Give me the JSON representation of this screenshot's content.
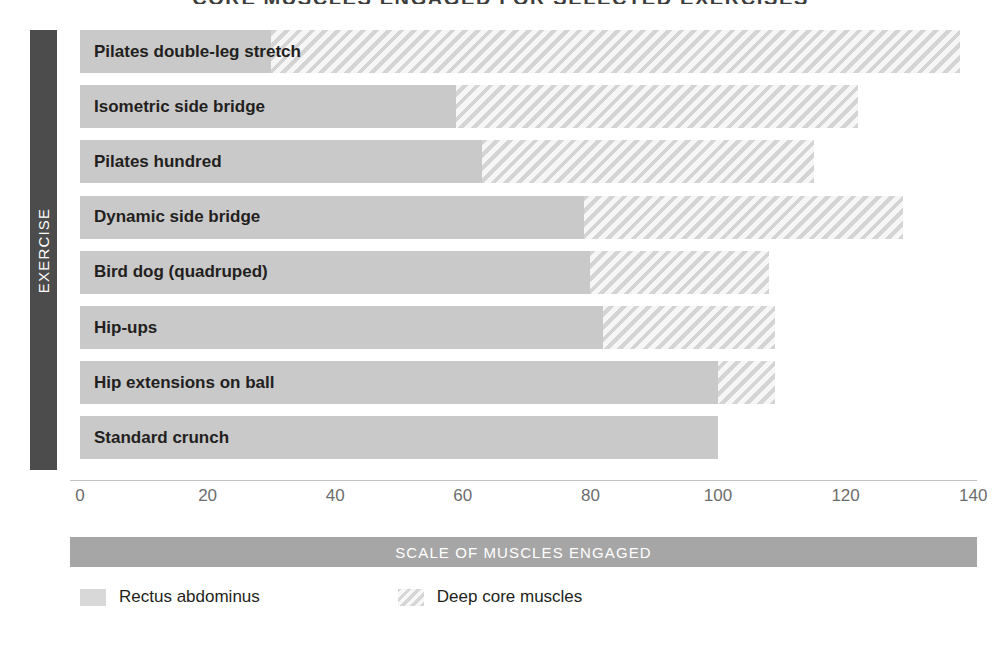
{
  "chart_data": {
    "type": "bar",
    "orientation": "horizontal",
    "stacked": true,
    "title": "CORE MUSCLES ENGAGED FOR SELECTED EXERCISES",
    "xlabel": "SCALE OF MUSCLES ENGAGED",
    "ylabel": "EXERCISE",
    "xlim": [
      0,
      140
    ],
    "xticks": [
      0,
      20,
      40,
      60,
      80,
      100,
      120,
      140
    ],
    "xtick_labels": [
      "0",
      "20",
      "40",
      "60",
      "80",
      "100",
      "120",
      "140"
    ],
    "grid": false,
    "legend_position": "bottom-left",
    "categories": [
      "Pilates double-leg stretch",
      "Isometric side bridge",
      "Pilates hundred",
      "Dynamic side bridge",
      "Bird dog (quadruped)",
      "Hip-ups",
      "Hip extensions on ball",
      "Standard crunch"
    ],
    "series": [
      {
        "name": "Rectus abdominus",
        "pattern": "solid",
        "color": "#c9c9c9",
        "values": [
          30,
          59,
          63,
          79,
          80,
          82,
          100,
          100
        ]
      },
      {
        "name": "Deep core muscles",
        "pattern": "diagonal-hatch",
        "color": "#eeeeee",
        "values": [
          108,
          63,
          52,
          50,
          28,
          27,
          9,
          0
        ]
      }
    ],
    "totals": [
      138,
      122,
      115,
      129,
      108,
      109,
      109,
      100
    ]
  },
  "legend": {
    "items": [
      {
        "label": "Rectus abdominus",
        "swatch": "solid"
      },
      {
        "label": "Deep core muscles",
        "swatch": "hatch"
      }
    ]
  },
  "colors": {
    "axis_title_bar_x": "#a6a6a6",
    "axis_title_bar_y": "#4c4c4c",
    "bar_solid": "#c9c9c9",
    "bar_hatch_bg": "#efefef",
    "bar_hatch_stripe": "#d4d4d4",
    "axis_line": "#c2c2c2",
    "tick_text": "#6d6d6d",
    "label_text": "#231f20",
    "bar_text_on_dark": "#ffffff"
  }
}
